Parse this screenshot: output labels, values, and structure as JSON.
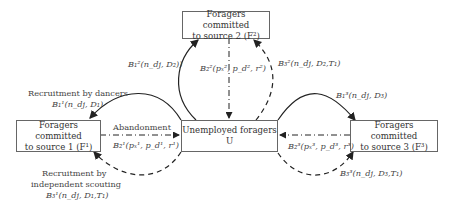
{
  "nodes": {
    "source2": {
      "line1": "Foragers committed",
      "line2": "to source 2 (F²)"
    },
    "source1": {
      "line1": "Foragers committed",
      "line2": "to source 1 (F¹)"
    },
    "unemployed": {
      "line1": "Unemployed foragers",
      "line2": "U"
    },
    "source3": {
      "line1": "Foragers committed",
      "line2": "to source 3 (F³)"
    }
  },
  "labels": {
    "b1_2": "B₁²(n_dj, D₂))",
    "b2_2": "B₂²(pₓ², p_d², r²)",
    "b3_2": "B₃²(n_dj, D₂,T₁)",
    "recruit_dancers": "Recruitment by dancers",
    "b1_1": "B₁¹(n_dj, D₁)",
    "abandonment": "Abandonment",
    "b2_1": "B₂¹(pₓ¹, p_d¹, r¹)",
    "recruit_scouting_1": "Recruitment by",
    "recruit_scouting_2": "independent scouting",
    "b3_1": "B₃¹(n_dj, D₁,T₁)",
    "b1_3": "B₁³(n_dj, D₃)",
    "b2_3": "B₂³(pₓ³, p_d³, r³)",
    "b3_3": "B₃³(n_dj, D₃,T₁)"
  }
}
